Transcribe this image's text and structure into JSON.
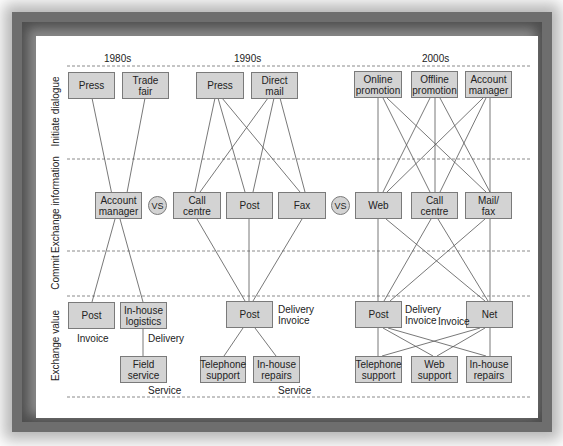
{
  "diagram": {
    "eras": [
      "1980s",
      "1990s",
      "2000s"
    ],
    "rows": [
      "Initiate dialogue",
      "Exchange information",
      "Commit",
      "Exchange value"
    ],
    "vs_label": "VS",
    "boxes": {
      "e80_press": "Press",
      "e80_trade_fair": "Trade\nfair",
      "e80_account_manager": "Account\nmanager",
      "e80_post": "Post",
      "e80_inhouse_logistics": "In-house\nlogistics",
      "e80_field_service": "Field\nservice",
      "e90_press": "Press",
      "e90_direct_mail": "Direct\nmail",
      "e90_call_centre": "Call\ncentre",
      "e90_post_info": "Post",
      "e90_fax": "Fax",
      "e90_post_value": "Post",
      "e90_telephone_support": "Telephone\nsupport",
      "e90_inhouse_repairs": "In-house\nrepairs",
      "e00_online_promotion": "Online\npromotion",
      "e00_offline_promotion": "Offline\npromotion",
      "e00_account_manager": "Account\nmanager",
      "e00_web": "Web",
      "e00_call_centre": "Call\ncentre",
      "e00_mail_fax": "Mail/\nfax",
      "e00_post": "Post",
      "e00_net": "Net",
      "e00_telephone_support": "Telephone\nsupport",
      "e00_web_support": "Web\nsupport",
      "e00_inhouse_repairs": "In-house\nrepairs"
    },
    "notes": {
      "e80_invoice": "Invoice",
      "e80_delivery": "Delivery",
      "e80_service": "Service",
      "e90_delivery_invoice": "Delivery\nInvoice",
      "e90_service": "Service",
      "e00_delivery_invoice": "Delivery\nInvoice",
      "e00_invoice": "Invoice"
    },
    "colors": {
      "box_fill": "#d3d3d3",
      "box_border": "#7a7a7a",
      "line": "#555555",
      "frame": "#6e6e6e"
    }
  }
}
